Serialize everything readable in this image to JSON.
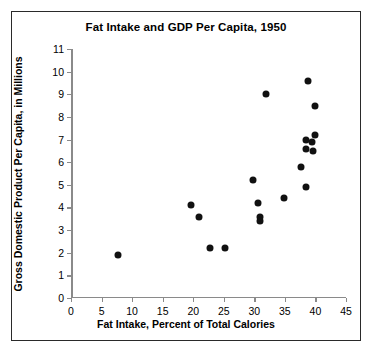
{
  "chart_data": {
    "type": "scatter",
    "title": "Fat Intake and GDP Per Capita, 1950",
    "xlabel": "Fat Intake, Percent of Total Calories",
    "ylabel": "Gross Domestic Product Per Capita, in Millions",
    "xlim": [
      0,
      45
    ],
    "ylim": [
      0,
      11
    ],
    "xticks": [
      0,
      5,
      10,
      15,
      20,
      25,
      30,
      35,
      40,
      45
    ],
    "yticks": [
      0,
      1,
      2,
      3,
      4,
      5,
      6,
      7,
      8,
      9,
      10,
      11
    ],
    "grid": false,
    "legend": null,
    "marker": {
      "shape": "circle",
      "color": "#111111",
      "size": 7
    },
    "points": [
      {
        "x": 7.7,
        "y": 1.9
      },
      {
        "x": 19.6,
        "y": 4.1
      },
      {
        "x": 20.9,
        "y": 3.6
      },
      {
        "x": 22.8,
        "y": 2.2
      },
      {
        "x": 25.2,
        "y": 2.2
      },
      {
        "x": 29.8,
        "y": 5.2
      },
      {
        "x": 30.6,
        "y": 4.2
      },
      {
        "x": 30.9,
        "y": 3.6
      },
      {
        "x": 30.9,
        "y": 3.4
      },
      {
        "x": 31.9,
        "y": 9.0
      },
      {
        "x": 34.8,
        "y": 4.4
      },
      {
        "x": 37.6,
        "y": 5.8
      },
      {
        "x": 38.4,
        "y": 4.9
      },
      {
        "x": 38.5,
        "y": 7.0
      },
      {
        "x": 38.5,
        "y": 6.6
      },
      {
        "x": 38.8,
        "y": 9.6
      },
      {
        "x": 39.5,
        "y": 6.9
      },
      {
        "x": 39.6,
        "y": 6.5
      },
      {
        "x": 39.9,
        "y": 8.5
      },
      {
        "x": 39.9,
        "y": 7.2
      }
    ]
  }
}
